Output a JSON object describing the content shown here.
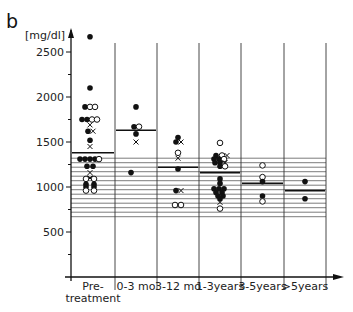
{
  "panel_label": "b",
  "chart_data": {
    "type": "scatter",
    "title": "",
    "xlabel": "",
    "ylabel": "[mg/dl]",
    "ylim": [
      0,
      2750
    ],
    "yticks": [
      500,
      1000,
      1500,
      2000,
      2500
    ],
    "yminor_ticks": [
      250,
      750,
      1250,
      1750,
      2250
    ],
    "grid": "horizontal reference band",
    "reference_band": {
      "from": 670,
      "to": 1330,
      "step": 50
    },
    "legend": null,
    "marker_legend": {
      "filled-circle": "filled dot",
      "open-circle": "open circle",
      "cross": "x"
    },
    "categories": [
      "Pre-\ntreatment",
      "0-3 mo",
      "3-12 mo",
      "1-3 years",
      "3-5 years",
      ">5 years"
    ],
    "category_labels": [
      [
        "Pre-",
        "treatment"
      ],
      [
        "0-3 mo"
      ],
      [
        "3-12 mo"
      ],
      [
        "1-3years"
      ],
      [
        "3-5years"
      ],
      [
        ">5years"
      ]
    ],
    "means": [
      1380,
      1630,
      1220,
      1160,
      1040,
      960
    ],
    "points": [
      [
        {
          "v": 2670,
          "m": "f",
          "dx": 0
        },
        {
          "v": 2100,
          "m": "f",
          "dx": 0
        },
        {
          "v": 1890,
          "m": "f",
          "dx": -5
        },
        {
          "v": 1890,
          "m": "o",
          "dx": 0
        },
        {
          "v": 1890,
          "m": "o",
          "dx": 5
        },
        {
          "v": 1750,
          "m": "f",
          "dx": -8
        },
        {
          "v": 1750,
          "m": "f",
          "dx": -3
        },
        {
          "v": 1750,
          "m": "o",
          "dx": 2
        },
        {
          "v": 1750,
          "m": "o",
          "dx": 7
        },
        {
          "v": 1690,
          "m": "x",
          "dx": 0
        },
        {
          "v": 1620,
          "m": "f",
          "dx": -2
        },
        {
          "v": 1620,
          "m": "x",
          "dx": 3
        },
        {
          "v": 1520,
          "m": "f",
          "dx": 0
        },
        {
          "v": 1450,
          "m": "x",
          "dx": 0
        },
        {
          "v": 1310,
          "m": "f",
          "dx": -10
        },
        {
          "v": 1310,
          "m": "f",
          "dx": -5
        },
        {
          "v": 1310,
          "m": "f",
          "dx": 0
        },
        {
          "v": 1310,
          "m": "f",
          "dx": 5
        },
        {
          "v": 1310,
          "m": "o",
          "dx": 9
        },
        {
          "v": 1230,
          "m": "f",
          "dx": -3
        },
        {
          "v": 1230,
          "m": "f",
          "dx": 3
        },
        {
          "v": 1160,
          "m": "x",
          "dx": 0
        },
        {
          "v": 1100,
          "m": "x",
          "dx": 0
        },
        {
          "v": 1090,
          "m": "o",
          "dx": -4
        },
        {
          "v": 1090,
          "m": "o",
          "dx": 4
        },
        {
          "v": 1030,
          "m": "f",
          "dx": -4
        },
        {
          "v": 1030,
          "m": "f",
          "dx": 4
        },
        {
          "v": 1000,
          "m": "f",
          "dx": -4
        },
        {
          "v": 1000,
          "m": "f",
          "dx": 4
        },
        {
          "v": 960,
          "m": "o",
          "dx": -4
        },
        {
          "v": 960,
          "m": "o",
          "dx": 4
        }
      ],
      [
        {
          "v": 1890,
          "m": "f",
          "dx": 0
        },
        {
          "v": 1670,
          "m": "f",
          "dx": -2
        },
        {
          "v": 1670,
          "m": "o",
          "dx": 3
        },
        {
          "v": 1590,
          "m": "f",
          "dx": 0
        },
        {
          "v": 1500,
          "m": "x",
          "dx": 0
        },
        {
          "v": 1160,
          "m": "f",
          "dx": -5
        }
      ],
      [
        {
          "v": 1550,
          "m": "f",
          "dx": 0
        },
        {
          "v": 1500,
          "m": "f",
          "dx": -2
        },
        {
          "v": 1500,
          "m": "x",
          "dx": 3
        },
        {
          "v": 1380,
          "m": "o",
          "dx": 0
        },
        {
          "v": 1320,
          "m": "x",
          "dx": 0
        },
        {
          "v": 1200,
          "m": "f",
          "dx": 0
        },
        {
          "v": 960,
          "m": "f",
          "dx": -2
        },
        {
          "v": 960,
          "m": "x",
          "dx": 3
        },
        {
          "v": 800,
          "m": "o",
          "dx": -3
        },
        {
          "v": 800,
          "m": "o",
          "dx": 3
        }
      ],
      [
        {
          "v": 1490,
          "m": "o",
          "dx": 0
        },
        {
          "v": 1350,
          "m": "f",
          "dx": -4
        },
        {
          "v": 1350,
          "m": "o",
          "dx": 2
        },
        {
          "v": 1350,
          "m": "x",
          "dx": 7
        },
        {
          "v": 1310,
          "m": "f",
          "dx": -6
        },
        {
          "v": 1310,
          "m": "f",
          "dx": -1
        },
        {
          "v": 1310,
          "m": "o",
          "dx": 4
        },
        {
          "v": 1270,
          "m": "f",
          "dx": -5
        },
        {
          "v": 1270,
          "m": "f",
          "dx": 0
        },
        {
          "v": 1270,
          "m": "x",
          "dx": 5
        },
        {
          "v": 1230,
          "m": "f",
          "dx": 0
        },
        {
          "v": 1230,
          "m": "o",
          "dx": 5
        },
        {
          "v": 1090,
          "m": "f",
          "dx": 0
        },
        {
          "v": 1040,
          "m": "f",
          "dx": 0
        },
        {
          "v": 980,
          "m": "f",
          "dx": -6
        },
        {
          "v": 980,
          "m": "f",
          "dx": -1
        },
        {
          "v": 980,
          "m": "f",
          "dx": 4
        },
        {
          "v": 940,
          "m": "f",
          "dx": -4
        },
        {
          "v": 940,
          "m": "f",
          "dx": 2
        },
        {
          "v": 900,
          "m": "f",
          "dx": -2
        },
        {
          "v": 900,
          "m": "f",
          "dx": 3
        },
        {
          "v": 870,
          "m": "f",
          "dx": 0
        },
        {
          "v": 830,
          "m": "x",
          "dx": 0
        },
        {
          "v": 760,
          "m": "o",
          "dx": 0
        }
      ],
      [
        {
          "v": 1240,
          "m": "o",
          "dx": 0
        },
        {
          "v": 1110,
          "m": "o",
          "dx": 0
        },
        {
          "v": 1060,
          "m": "f",
          "dx": 0
        },
        {
          "v": 900,
          "m": "f",
          "dx": 0
        },
        {
          "v": 840,
          "m": "o",
          "dx": 0
        }
      ],
      [
        {
          "v": 1060,
          "m": "f",
          "dx": 0
        },
        {
          "v": 870,
          "m": "f",
          "dx": 0
        }
      ]
    ]
  }
}
